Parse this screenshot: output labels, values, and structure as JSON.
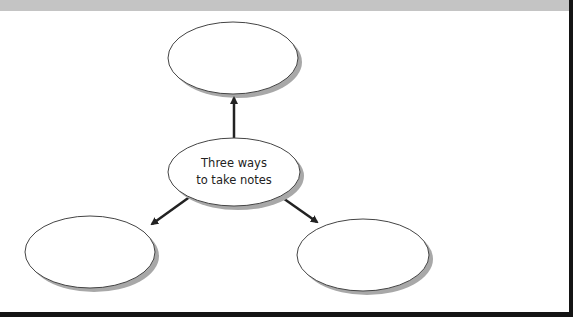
{
  "diagram": {
    "type": "concept-map",
    "center": {
      "label_lines": [
        "Three ways",
        "to take notes"
      ]
    },
    "branches": [
      {
        "position": "top",
        "label": ""
      },
      {
        "position": "bottom-left",
        "label": ""
      },
      {
        "position": "bottom-right",
        "label": ""
      }
    ]
  },
  "colors": {
    "top_band": "#c4c4c4",
    "frame": "#141414",
    "ellipse_stroke": "#444444",
    "shadow": "#a8a8a8",
    "arrow": "#222222"
  }
}
